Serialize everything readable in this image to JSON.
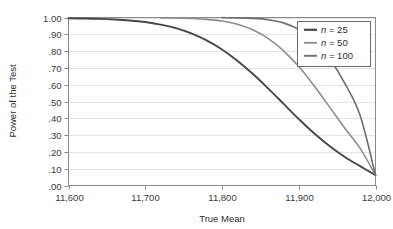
{
  "chart_data": {
    "type": "line",
    "title": "",
    "xlabel": "True Mean",
    "ylabel": "Power of the Test",
    "xlim": [
      11600,
      12000
    ],
    "ylim": [
      0.0,
      1.0
    ],
    "grid": true,
    "legend_position": "top-right",
    "xticks": [
      11600,
      11700,
      11800,
      11900,
      12000
    ],
    "xtick_labels": [
      "11,600",
      "11,700",
      "11,800",
      "11,900",
      "12,000"
    ],
    "yticks": [
      0.0,
      0.1,
      0.2,
      0.3,
      0.4,
      0.5,
      0.6,
      0.7,
      0.8,
      0.9,
      1.0
    ],
    "ytick_labels": [
      ".00",
      ".10",
      ".20",
      ".30",
      ".40",
      ".50",
      ".60",
      ".70",
      ".80",
      ".90",
      "1.00"
    ],
    "series": [
      {
        "name": "n = 25",
        "legend_label": "n = 25",
        "color": "#474747",
        "width": 1.9,
        "x": [
          11600,
          11620,
          11640,
          11660,
          11680,
          11700,
          11720,
          11740,
          11760,
          11780,
          11800,
          11820,
          11840,
          11860,
          11880,
          11900,
          11920,
          11940,
          11960,
          11980,
          12000
        ],
        "values": [
          0.995,
          0.994,
          0.992,
          0.988,
          0.982,
          0.973,
          0.958,
          0.937,
          0.906,
          0.864,
          0.81,
          0.743,
          0.665,
          0.578,
          0.487,
          0.396,
          0.311,
          0.235,
          0.17,
          0.115,
          0.062
        ]
      },
      {
        "name": "n = 50",
        "legend_label": "n = 50",
        "color": "#8d8d8d",
        "width": 1.6,
        "x": [
          11720,
          11740,
          11760,
          11780,
          11800,
          11820,
          11840,
          11860,
          11880,
          11900,
          11920,
          11940,
          11960,
          11980,
          12000
        ],
        "values": [
          0.998,
          0.997,
          0.994,
          0.989,
          0.979,
          0.96,
          0.927,
          0.876,
          0.803,
          0.708,
          0.594,
          0.468,
          0.341,
          0.221,
          0.062
        ]
      },
      {
        "name": "n = 100",
        "legend_label": "n = 100",
        "color": "#6e6e6e",
        "width": 1.6,
        "x": [
          11800,
          11820,
          11840,
          11860,
          11880,
          11900,
          11920,
          11940,
          11960,
          11980,
          12000
        ],
        "values": [
          0.999,
          0.998,
          0.995,
          0.987,
          0.968,
          0.929,
          0.861,
          0.756,
          0.608,
          0.416,
          0.062
        ]
      }
    ]
  },
  "axes": {
    "xlabel": "True Mean",
    "ylabel": "Power of the Test"
  },
  "legend": {
    "entries": [
      {
        "prefix": "n",
        "suffix": " = 25"
      },
      {
        "prefix": "n",
        "suffix": " = 50"
      },
      {
        "prefix": "n",
        "suffix": " = 100"
      }
    ]
  },
  "colors": {
    "background": "#ffffff",
    "frame": "#8a8a8a",
    "grid": "#e2e2e2",
    "tick_text": "#3b3b3b",
    "legend_border": "#6b6b6b"
  }
}
